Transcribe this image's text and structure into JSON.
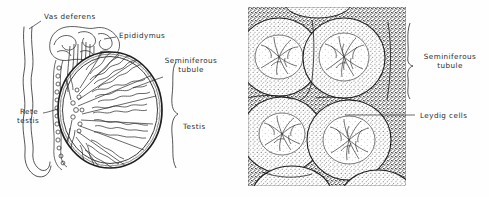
{
  "figure": {
    "type": "anatomical-illustration",
    "background_color": "#fefefe",
    "ink_color": "#2b2b2b",
    "panels": [
      {
        "id": "testis-sagittal-diagram",
        "name": "Diagrammatic section of the testis, epididymis and vas deferens",
        "style": "line drawing",
        "labels": [
          {
            "key": "vas_deferens",
            "text": "Vas  deferens"
          },
          {
            "key": "epididymus",
            "text": "Epididymus"
          },
          {
            "key": "seminiferous_tubule_line1",
            "text": "Seminiferous"
          },
          {
            "key": "seminiferous_tubule_line2",
            "text": "tubule"
          },
          {
            "key": "rete_testis_line1",
            "text": "Rete"
          },
          {
            "key": "rete_testis_line2",
            "text": "testis"
          },
          {
            "key": "testis",
            "text": "Testis"
          }
        ]
      },
      {
        "id": "testis-histology-drawing",
        "name": "Histological section through seminiferous tubules",
        "style": "stippled engraving",
        "labels": [
          {
            "key": "seminiferous_tubule_line1",
            "text": "Seminiferous"
          },
          {
            "key": "seminiferous_tubule_line2",
            "text": "tubule"
          },
          {
            "key": "leydig_cells",
            "text": "Leydig  cells"
          }
        ]
      }
    ]
  },
  "left_panel": {
    "vas_deferens": "Vas  deferens",
    "epididymus": "Epididymus",
    "seminiferous_tubule_l1": "Seminiferous",
    "seminiferous_tubule_l2": "tubule",
    "rete_testis_l1": "Rete",
    "rete_testis_l2": "testis",
    "testis": "Testis"
  },
  "right_panel": {
    "seminiferous_tubule_l1": "Seminiferous",
    "seminiferous_tubule_l2": "tubule",
    "leydig_cells": "Leydig  cells"
  }
}
